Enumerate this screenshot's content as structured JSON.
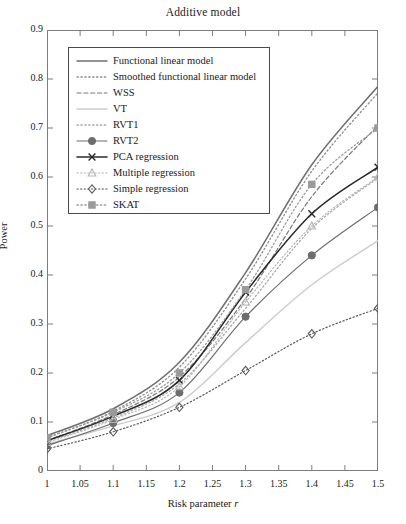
{
  "chart_data": {
    "type": "line",
    "title": "Additive model",
    "xlabel": "Risk parameter r",
    "ylabel": "Power",
    "xlim": [
      1.0,
      1.5
    ],
    "ylim": [
      0.0,
      0.9
    ],
    "xticks": [
      "1",
      "1.05",
      "1.1",
      "1.15",
      "1.2",
      "1.25",
      "1.3",
      "1.35",
      "1.4",
      "1.45",
      "1.5"
    ],
    "xtick_values": [
      1.0,
      1.05,
      1.1,
      1.15,
      1.2,
      1.25,
      1.3,
      1.35,
      1.4,
      1.45,
      1.5
    ],
    "yticks": [
      "0",
      "0.1",
      "0.2",
      "0.3",
      "0.4",
      "0.5",
      "0.6",
      "0.7",
      "0.8",
      "0.9"
    ],
    "ytick_values": [
      0,
      0.1,
      0.2,
      0.3,
      0.4,
      0.5,
      0.6,
      0.7,
      0.8,
      0.9
    ],
    "grid": false,
    "legend_position": "upper-left-inset",
    "x": [
      1.0,
      1.1,
      1.2,
      1.3,
      1.4,
      1.5
    ],
    "series": [
      {
        "name": "Functional linear model",
        "values": [
          0.072,
          0.127,
          0.222,
          0.405,
          0.625,
          0.785
        ],
        "color": "#6f6f6f",
        "style": "solid",
        "marker": "none",
        "width": 1.5
      },
      {
        "name": "Smoothed functional linear model",
        "values": [
          0.068,
          0.122,
          0.212,
          0.392,
          0.612,
          0.772
        ],
        "color": "#8d8d8d",
        "style": "dotted",
        "marker": "none",
        "width": 1.3
      },
      {
        "name": "WSS",
        "values": [
          0.062,
          0.115,
          0.192,
          0.352,
          0.56,
          0.705
        ],
        "color": "#7a7a7a",
        "style": "dashed",
        "marker": "none",
        "width": 1.2
      },
      {
        "name": "VT",
        "values": [
          0.055,
          0.092,
          0.14,
          0.262,
          0.38,
          0.47
        ],
        "color": "#cccccc",
        "style": "solid",
        "marker": "none",
        "width": 1.4
      },
      {
        "name": "RVT1",
        "values": [
          0.06,
          0.108,
          0.178,
          0.332,
          0.495,
          0.598
        ],
        "color": "#a8a8a8",
        "style": "dotted",
        "marker": "none",
        "width": 1.3
      },
      {
        "name": "RVT2",
        "values": [
          0.052,
          0.098,
          0.16,
          0.315,
          0.44,
          0.538
        ],
        "color": "#6d6d6d",
        "style": "solid",
        "marker": "circle-filled",
        "width": 1.2
      },
      {
        "name": "PCA regression",
        "values": [
          0.062,
          0.112,
          0.185,
          0.365,
          0.525,
          0.62
        ],
        "color": "#2b2b2b",
        "style": "solid",
        "marker": "x",
        "width": 1.6
      },
      {
        "name": "Multiple regression",
        "values": [
          0.058,
          0.105,
          0.172,
          0.345,
          0.5,
          0.6
        ],
        "color": "#b5b5b5",
        "style": "dotted",
        "marker": "triangle",
        "width": 1.2
      },
      {
        "name": "Simple regression",
        "values": [
          0.045,
          0.08,
          0.13,
          0.205,
          0.28,
          0.332
        ],
        "color": "#595959",
        "style": "dotted",
        "marker": "diamond",
        "width": 1.2
      },
      {
        "name": "SKAT",
        "values": [
          0.068,
          0.12,
          0.2,
          0.37,
          0.585,
          0.7
        ],
        "color": "#9a9a9a",
        "style": "dotted",
        "marker": "square",
        "width": 1.3
      }
    ]
  }
}
